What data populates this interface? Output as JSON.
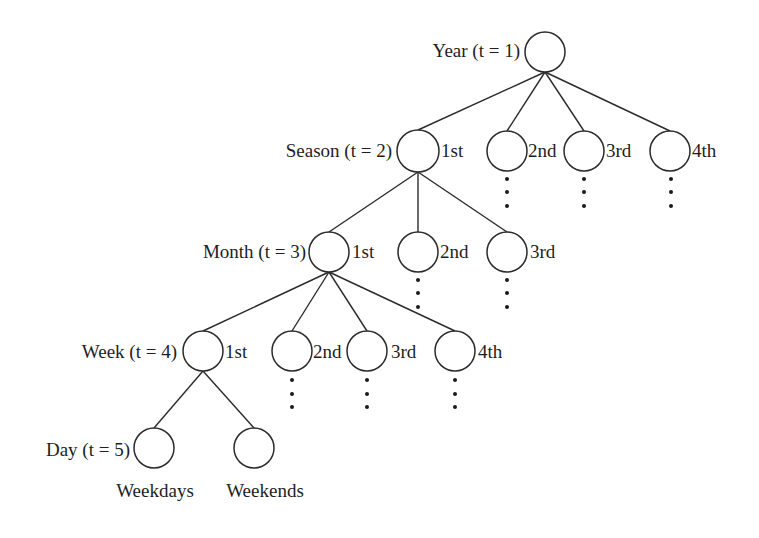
{
  "diagram": {
    "colors": {
      "stroke": "#2b2b2b",
      "text": "#1e1e1e",
      "background": "#ffffff"
    },
    "level_labels": [
      {
        "id": "year",
        "text": "Year (t = 1)",
        "x": 520,
        "y": 57,
        "anchor": "end"
      },
      {
        "id": "season",
        "text": "Season (t = 2)",
        "x": 392,
        "y": 157,
        "anchor": "end"
      },
      {
        "id": "month",
        "text": "Month (t = 3)",
        "x": 306,
        "y": 258,
        "anchor": "end"
      },
      {
        "id": "week",
        "text": "Week (t = 4)",
        "x": 177,
        "y": 358,
        "anchor": "end"
      },
      {
        "id": "day",
        "text": "Day (t = 5)",
        "x": 130,
        "y": 456,
        "anchor": "end"
      }
    ],
    "nodes": [
      {
        "id": "year-root",
        "cx": 545,
        "cy": 52,
        "r": 20,
        "label": "",
        "lx": 0,
        "ly": 0,
        "anchor": "start"
      },
      {
        "id": "season-1",
        "cx": 418,
        "cy": 151,
        "r": 21,
        "label": "1st",
        "lx": 441,
        "ly": 157,
        "anchor": "start"
      },
      {
        "id": "season-2",
        "cx": 507,
        "cy": 151,
        "r": 20,
        "label": "2nd",
        "lx": 528,
        "ly": 157,
        "anchor": "start"
      },
      {
        "id": "season-3",
        "cx": 584,
        "cy": 151,
        "r": 20,
        "label": "3rd",
        "lx": 606,
        "ly": 157,
        "anchor": "start"
      },
      {
        "id": "season-4",
        "cx": 670,
        "cy": 151,
        "r": 20,
        "label": "4th",
        "lx": 692,
        "ly": 157,
        "anchor": "start"
      },
      {
        "id": "month-1",
        "cx": 329,
        "cy": 252,
        "r": 20,
        "label": "1st",
        "lx": 352,
        "ly": 258,
        "anchor": "start"
      },
      {
        "id": "month-2",
        "cx": 418,
        "cy": 252,
        "r": 20,
        "label": "2nd",
        "lx": 440,
        "ly": 258,
        "anchor": "start"
      },
      {
        "id": "month-3",
        "cx": 507,
        "cy": 252,
        "r": 20,
        "label": "3rd",
        "lx": 530,
        "ly": 258,
        "anchor": "start"
      },
      {
        "id": "week-1",
        "cx": 203,
        "cy": 351,
        "r": 20,
        "label": "1st",
        "lx": 225,
        "ly": 358,
        "anchor": "start"
      },
      {
        "id": "week-2",
        "cx": 292,
        "cy": 351,
        "r": 20,
        "label": "2nd",
        "lx": 313,
        "ly": 358,
        "anchor": "start"
      },
      {
        "id": "week-3",
        "cx": 367,
        "cy": 351,
        "r": 20,
        "label": "3rd",
        "lx": 391,
        "ly": 358,
        "anchor": "start"
      },
      {
        "id": "week-4",
        "cx": 455,
        "cy": 351,
        "r": 20,
        "label": "4th",
        "lx": 478,
        "ly": 358,
        "anchor": "start"
      },
      {
        "id": "day-weekdays",
        "cx": 154,
        "cy": 448,
        "r": 20,
        "label": "Weekdays",
        "lx": 155,
        "ly": 497,
        "anchor": "middle"
      },
      {
        "id": "day-weekends",
        "cx": 254,
        "cy": 448,
        "r": 20,
        "label": "Weekends",
        "lx": 265,
        "ly": 497,
        "anchor": "middle"
      }
    ],
    "edges": [
      [
        "year-root",
        "season-1"
      ],
      [
        "year-root",
        "season-2"
      ],
      [
        "year-root",
        "season-3"
      ],
      [
        "year-root",
        "season-4"
      ],
      [
        "season-1",
        "month-1"
      ],
      [
        "season-1",
        "month-2"
      ],
      [
        "season-1",
        "month-3"
      ],
      [
        "month-1",
        "week-1"
      ],
      [
        "month-1",
        "week-2"
      ],
      [
        "month-1",
        "week-3"
      ],
      [
        "month-1",
        "week-4"
      ],
      [
        "week-1",
        "day-weekdays"
      ],
      [
        "week-1",
        "day-weekends"
      ]
    ],
    "continuation_dots": [
      {
        "node": "season-2",
        "x": 507,
        "ys": [
          179,
          192,
          206
        ]
      },
      {
        "node": "season-3",
        "x": 584,
        "ys": [
          179,
          192,
          206
        ]
      },
      {
        "node": "season-4",
        "x": 671,
        "ys": [
          179,
          192,
          206
        ]
      },
      {
        "node": "month-2",
        "x": 418,
        "ys": [
          280,
          293,
          307
        ]
      },
      {
        "node": "month-3",
        "x": 507,
        "ys": [
          280,
          293,
          307
        ]
      },
      {
        "node": "week-2",
        "x": 292,
        "ys": [
          380,
          394,
          407
        ]
      },
      {
        "node": "week-3",
        "x": 367,
        "ys": [
          380,
          394,
          407
        ]
      },
      {
        "node": "week-4",
        "x": 455,
        "ys": [
          380,
          394,
          407
        ]
      }
    ]
  }
}
